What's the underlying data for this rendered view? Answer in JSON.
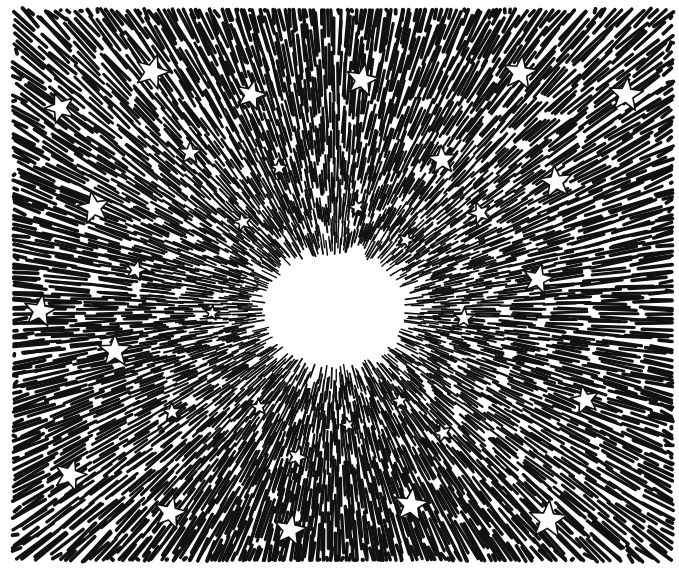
{
  "illustration": {
    "title": "Starburst with stars",
    "style": "black ink line drawing",
    "colors": {
      "ink": "#111111",
      "paper": "#ffffff"
    },
    "center": [
      335,
      310
    ],
    "glow_radius": [
      70,
      55
    ],
    "bounds": {
      "left": 14,
      "top": 10,
      "right": 672,
      "bottom": 560
    },
    "stars": [
      [
        60,
        108,
        16
      ],
      [
        152,
        72,
        18
      ],
      [
        251,
        95,
        16
      ],
      [
        362,
        80,
        17
      ],
      [
        520,
        73,
        18
      ],
      [
        626,
        95,
        18
      ],
      [
        190,
        153,
        12
      ],
      [
        279,
        168,
        9
      ],
      [
        442,
        160,
        15
      ],
      [
        556,
        182,
        17
      ],
      [
        94,
        208,
        17
      ],
      [
        243,
        222,
        10
      ],
      [
        357,
        207,
        9
      ],
      [
        480,
        213,
        12
      ],
      [
        406,
        240,
        9
      ],
      [
        136,
        270,
        11
      ],
      [
        538,
        279,
        16
      ],
      [
        40,
        311,
        17
      ],
      [
        212,
        313,
        8
      ],
      [
        464,
        318,
        11
      ],
      [
        115,
        351,
        17
      ],
      [
        172,
        412,
        10
      ],
      [
        259,
        407,
        9
      ],
      [
        400,
        401,
        9
      ],
      [
        585,
        400,
        15
      ],
      [
        348,
        425,
        8
      ],
      [
        443,
        433,
        10
      ],
      [
        297,
        457,
        11
      ],
      [
        70,
        475,
        17
      ],
      [
        170,
        513,
        17
      ],
      [
        290,
        530,
        17
      ],
      [
        411,
        505,
        18
      ],
      [
        548,
        520,
        20
      ]
    ]
  }
}
